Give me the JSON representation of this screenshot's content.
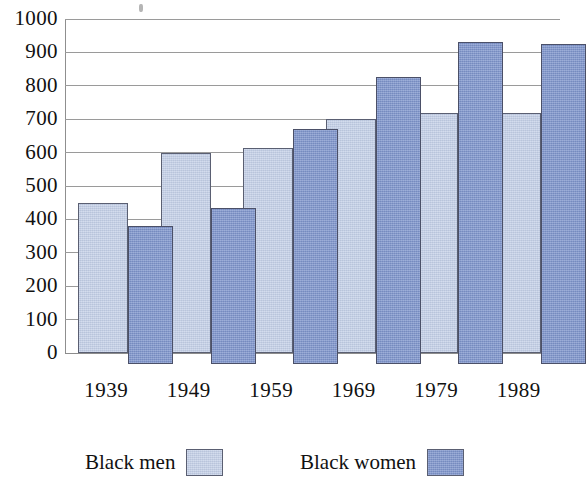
{
  "chart_data": {
    "type": "bar",
    "title": "",
    "subtitle": "",
    "xlabel": "",
    "ylabel": "",
    "categories": [
      "1939",
      "1949",
      "1959",
      "1969",
      "1979",
      "1989"
    ],
    "series": [
      {
        "name": "Black men",
        "color": "#c4d0e8",
        "values": [
          450,
          600,
          615,
          700,
          720,
          720
        ]
      },
      {
        "name": "Black women",
        "color": "#7d93cb",
        "values": [
          380,
          435,
          670,
          825,
          930,
          925
        ]
      }
    ],
    "ylim": [
      0,
      1000
    ],
    "ytick_values": [
      0,
      100,
      200,
      300,
      400,
      500,
      600,
      700,
      800,
      900,
      1000
    ],
    "ytick_labels": [
      "0",
      "100",
      "200",
      "300",
      "400",
      "500",
      "600",
      "700",
      "800",
      "900",
      "1000"
    ],
    "grid": true,
    "grid_axis": "y",
    "legend_position": "bottom",
    "bar_style": "overlapping-offset"
  },
  "legend": {
    "entries": [
      {
        "label": "Black men",
        "color": "#c4d0e8"
      },
      {
        "label": "Black women",
        "color": "#7d93cb"
      }
    ]
  },
  "colors": {
    "men": "#c4d0e8",
    "women": "#7d93cb",
    "grid": "#9a9a9a",
    "axis": "#8f8f8f",
    "text": "#111111",
    "background": "#ffffff"
  }
}
